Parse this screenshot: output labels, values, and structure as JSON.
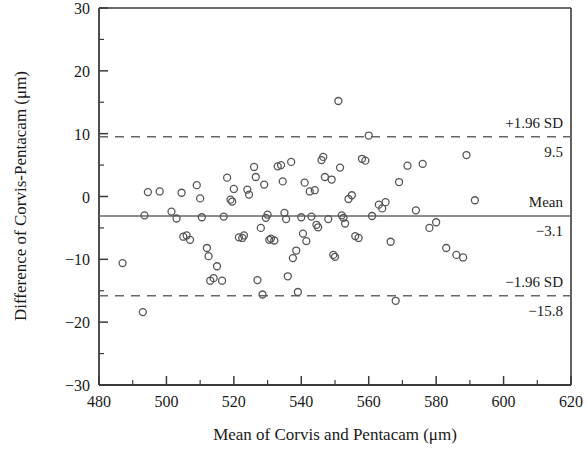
{
  "chart_data": {
    "type": "scatter",
    "title": "",
    "subtitle": "",
    "xlabel": "Mean of Corvis and Pentacam (μm)",
    "ylabel": "Difference of Corvis-Pentacam (μm)",
    "xlim": [
      480,
      620
    ],
    "ylim": [
      -30,
      30
    ],
    "xticks": [
      480,
      500,
      520,
      540,
      560,
      580,
      600,
      620
    ],
    "xtick_labels": [
      "480",
      "500",
      "520",
      "540",
      "560",
      "580",
      "600",
      "620"
    ],
    "x_minor_ticks": [
      490,
      510,
      530,
      550,
      570,
      590,
      610
    ],
    "yticks": [
      -30,
      -20,
      -10,
      0,
      10,
      20,
      30
    ],
    "ytick_labels": [
      "−30",
      "−20",
      "−10",
      "0",
      "10",
      "20",
      "30"
    ],
    "y_minor_ticks": [
      -25,
      -15,
      -5,
      5,
      15,
      25
    ],
    "grid": false,
    "legend": null,
    "marker": "open-circle",
    "marker_color": "#555555",
    "marker_size": 7,
    "reference_lines": [
      {
        "name": "upper-limit-of-agreement",
        "value": 9.5,
        "style": "dashed",
        "label": "+1.96 SD",
        "value_label": "9.5"
      },
      {
        "name": "mean-difference",
        "value": -3.1,
        "style": "solid",
        "label": "Mean",
        "value_label": "−3.1"
      },
      {
        "name": "lower-limit-of-agreement",
        "value": -15.8,
        "style": "dashed",
        "label": "−1.96 SD",
        "value_label": "−15.8"
      }
    ],
    "points": [
      [
        487.0,
        -10.6
      ],
      [
        493.0,
        -18.4
      ],
      [
        493.5,
        -3.0
      ],
      [
        494.5,
        0.7
      ],
      [
        498.0,
        0.8
      ],
      [
        501.5,
        -2.4
      ],
      [
        503.0,
        -3.5
      ],
      [
        504.5,
        0.6
      ],
      [
        505.0,
        -6.4
      ],
      [
        506.0,
        -6.2
      ],
      [
        507.0,
        -6.9
      ],
      [
        509.0,
        1.8
      ],
      [
        510.0,
        -0.3
      ],
      [
        510.5,
        -3.3
      ],
      [
        512.0,
        -8.2
      ],
      [
        512.5,
        -9.5
      ],
      [
        513.0,
        -13.4
      ],
      [
        514.0,
        -13.0
      ],
      [
        515.0,
        -11.1
      ],
      [
        516.5,
        -13.4
      ],
      [
        517.0,
        -3.2
      ],
      [
        518.0,
        3.0
      ],
      [
        519.0,
        -0.5
      ],
      [
        519.5,
        -0.8
      ],
      [
        520.0,
        1.2
      ],
      [
        521.5,
        -6.5
      ],
      [
        522.5,
        -6.6
      ],
      [
        523.0,
        -6.2
      ],
      [
        524.0,
        1.1
      ],
      [
        524.5,
        0.3
      ],
      [
        526.0,
        4.7
      ],
      [
        526.5,
        3.1
      ],
      [
        527.0,
        -13.3
      ],
      [
        528.0,
        -5.0
      ],
      [
        528.5,
        -15.6
      ],
      [
        529.0,
        1.9
      ],
      [
        529.5,
        -3.4
      ],
      [
        530.0,
        -2.9
      ],
      [
        530.5,
        -6.9
      ],
      [
        531.0,
        -6.7
      ],
      [
        532.0,
        -7.0
      ],
      [
        533.0,
        4.8
      ],
      [
        534.0,
        5.0
      ],
      [
        534.5,
        2.4
      ],
      [
        535.0,
        -2.6
      ],
      [
        535.5,
        -3.6
      ],
      [
        536.0,
        -12.7
      ],
      [
        537.0,
        5.5
      ],
      [
        537.5,
        -9.8
      ],
      [
        538.5,
        -8.6
      ],
      [
        539.0,
        -15.2
      ],
      [
        540.0,
        -3.3
      ],
      [
        540.5,
        -5.9
      ],
      [
        541.0,
        2.2
      ],
      [
        541.5,
        -7.1
      ],
      [
        542.5,
        0.8
      ],
      [
        543.0,
        -3.2
      ],
      [
        544.0,
        1.0
      ],
      [
        544.5,
        -4.5
      ],
      [
        545.0,
        -4.9
      ],
      [
        546.0,
        5.8
      ],
      [
        546.5,
        6.3
      ],
      [
        547.0,
        3.1
      ],
      [
        548.0,
        -3.6
      ],
      [
        549.0,
        2.7
      ],
      [
        549.5,
        -9.3
      ],
      [
        550.0,
        -9.6
      ],
      [
        551.0,
        15.2
      ],
      [
        551.5,
        4.6
      ],
      [
        552.0,
        -3.0
      ],
      [
        552.5,
        -3.4
      ],
      [
        553.0,
        -4.3
      ],
      [
        554.0,
        -0.4
      ],
      [
        555.0,
        0.2
      ],
      [
        556.0,
        -6.3
      ],
      [
        557.0,
        -6.6
      ],
      [
        558.0,
        6.0
      ],
      [
        559.0,
        5.7
      ],
      [
        560.0,
        9.7
      ],
      [
        561.0,
        -3.1
      ],
      [
        563.0,
        -1.3
      ],
      [
        564.0,
        -1.9
      ],
      [
        565.0,
        -0.9
      ],
      [
        566.5,
        -7.2
      ],
      [
        568.0,
        -16.6
      ],
      [
        569.0,
        2.3
      ],
      [
        571.5,
        4.9
      ],
      [
        574.0,
        -2.2
      ],
      [
        576.0,
        5.2
      ],
      [
        578.0,
        -5.0
      ],
      [
        580.0,
        -4.1
      ],
      [
        583.0,
        -8.2
      ],
      [
        586.0,
        -9.3
      ],
      [
        588.0,
        -9.7
      ],
      [
        589.0,
        6.6
      ],
      [
        591.5,
        -0.6
      ]
    ]
  },
  "annotations": {
    "upper_label": "+1.96 SD",
    "upper_value": "9.5",
    "mean_label": "Mean",
    "mean_value": "−3.1",
    "lower_label": "−1.96 SD",
    "lower_value": "−15.8"
  },
  "axes": {
    "x_title": "Mean of Corvis and Pentacam (μm)",
    "y_title": "Difference of Corvis-Pentacam (μm)",
    "x_labels": [
      "480",
      "500",
      "520",
      "540",
      "560",
      "580",
      "600",
      "620"
    ],
    "y_labels": [
      "30",
      "20",
      "10",
      "0",
      "−10",
      "−20",
      "−30"
    ]
  },
  "colors": {
    "frame": "#3a3a3a",
    "marker": "#555555",
    "mean_line": "#666666",
    "limit_line": "#666666",
    "text": "#1a1a1a",
    "background": "#ffffff"
  }
}
